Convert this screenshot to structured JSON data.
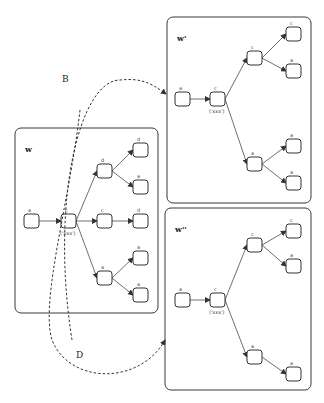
{
  "diagram": {
    "type": "state-transition",
    "colors": {
      "stroke": "#333333",
      "background": "#ffffff"
    },
    "worlds": [
      {
        "id": "w",
        "label": "w",
        "frame": {
          "x": 15,
          "y": 128,
          "w": 143,
          "h": 185
        },
        "nodes": [
          {
            "id": "w-a",
            "label": "a",
            "x": 24,
            "y": 214
          },
          {
            "id": "w-c",
            "label": "c",
            "sub": "('xxx')",
            "x": 61,
            "y": 214
          },
          {
            "id": "w-d1",
            "label": "d",
            "x": 97,
            "y": 164
          },
          {
            "id": "w-d1a",
            "label": "d",
            "x": 133,
            "y": 143
          },
          {
            "id": "w-d1b",
            "label": "a",
            "x": 133,
            "y": 180
          },
          {
            "id": "w-c2",
            "label": "c",
            "x": 97,
            "y": 214
          },
          {
            "id": "w-c2a",
            "label": "d",
            "x": 133,
            "y": 214
          },
          {
            "id": "w-a3",
            "label": "a",
            "x": 97,
            "y": 271
          },
          {
            "id": "w-a3a",
            "label": "a",
            "x": 133,
            "y": 251
          },
          {
            "id": "w-a3b",
            "label": "a",
            "x": 133,
            "y": 288
          }
        ],
        "edges": [
          [
            "w-a",
            "w-c"
          ],
          [
            "w-c",
            "w-d1"
          ],
          [
            "w-c",
            "w-c2"
          ],
          [
            "w-c",
            "w-a3"
          ],
          [
            "w-d1",
            "w-d1a"
          ],
          [
            "w-d1",
            "w-d1b"
          ],
          [
            "w-c2",
            "w-c2a"
          ],
          [
            "w-a3",
            "w-a3a"
          ],
          [
            "w-a3",
            "w-a3b"
          ]
        ]
      },
      {
        "id": "w1",
        "label": "w'",
        "frame": {
          "x": 167,
          "y": 17,
          "w": 144,
          "h": 186
        },
        "nodes": [
          {
            "id": "w1-a",
            "label": "a",
            "x": 175,
            "y": 92
          },
          {
            "id": "w1-c",
            "label": "c",
            "sub": "('xxx')",
            "x": 210,
            "y": 92
          },
          {
            "id": "w1-t",
            "label": "c",
            "x": 247,
            "y": 51
          },
          {
            "id": "w1-ta",
            "label": "c",
            "x": 286,
            "y": 27
          },
          {
            "id": "w1-tb",
            "label": "a",
            "x": 286,
            "y": 64
          },
          {
            "id": "w1-b",
            "label": "a",
            "x": 247,
            "y": 157
          },
          {
            "id": "w1-ba",
            "label": "a",
            "x": 286,
            "y": 139
          },
          {
            "id": "w1-bb",
            "label": "a",
            "x": 286,
            "y": 176
          }
        ],
        "edges": [
          [
            "w1-a",
            "w1-c"
          ],
          [
            "w1-c",
            "w1-t"
          ],
          [
            "w1-c",
            "w1-b"
          ],
          [
            "w1-t",
            "w1-ta"
          ],
          [
            "w1-t",
            "w1-tb"
          ],
          [
            "w1-b",
            "w1-ba"
          ],
          [
            "w1-b",
            "w1-bb"
          ]
        ]
      },
      {
        "id": "w2",
        "label": "w''",
        "frame": {
          "x": 165,
          "y": 208,
          "w": 146,
          "h": 182
        },
        "nodes": [
          {
            "id": "w2-a",
            "label": "a",
            "x": 175,
            "y": 293
          },
          {
            "id": "w2-c",
            "label": "c",
            "sub": "('xxx')",
            "x": 210,
            "y": 293
          },
          {
            "id": "w2-t",
            "label": "c",
            "x": 247,
            "y": 238
          },
          {
            "id": "w2-ta",
            "label": "c",
            "x": 286,
            "y": 224
          },
          {
            "id": "w2-tb",
            "label": "a",
            "x": 286,
            "y": 259
          },
          {
            "id": "w2-b",
            "label": "a",
            "x": 247,
            "y": 350
          },
          {
            "id": "w2-ba",
            "label": "a",
            "x": 286,
            "y": 367
          }
        ],
        "edges": [
          [
            "w2-a",
            "w2-c"
          ],
          [
            "w2-c",
            "w2-t"
          ],
          [
            "w2-c",
            "w2-b"
          ],
          [
            "w2-t",
            "w2-ta"
          ],
          [
            "w2-t",
            "w2-tb"
          ],
          [
            "w2-b",
            "w2-ba"
          ]
        ]
      }
    ],
    "transitions": [
      {
        "label": "B",
        "from": "w",
        "to": "w1",
        "path": "M 72 340 C 50 200, 80 80, 120 80 C 140 78, 150 82, 166 94",
        "label_x": 62,
        "label_y": 82
      },
      {
        "label": "D",
        "from": "w",
        "to": "w2",
        "path": "M 80 110 C 70 200, 40 300, 52 340 C 70 385, 140 385, 165 340",
        "label_x": 76,
        "label_y": 358
      }
    ]
  }
}
